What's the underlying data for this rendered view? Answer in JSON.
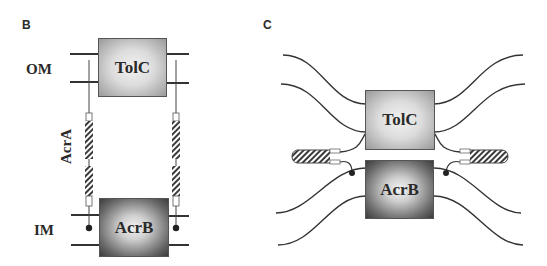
{
  "panels": {
    "B": {
      "label": "B",
      "membranes": {
        "outer": "OM",
        "inner": "IM"
      },
      "linker_label": "AcrA",
      "proteins": {
        "top": "TolC",
        "bottom": "AcrB"
      }
    },
    "C": {
      "label": "C",
      "proteins": {
        "top": "TolC",
        "bottom": "AcrB"
      }
    }
  },
  "colors": {
    "line": "#333333",
    "text": "#2a2a2a",
    "hatch": "#3a3a3a"
  }
}
